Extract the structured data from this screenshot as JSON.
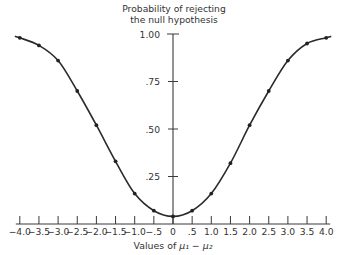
{
  "chart_data": {
    "type": "line",
    "title": "Probability of rejecting the null hypothesis",
    "title_lines": [
      "Probability of rejecting",
      "the null hypothesis"
    ],
    "xlabel": "Values of μ₁ − μ₂",
    "ylabel": "Probability of rejecting the null hypothesis",
    "x": [
      -4.0,
      -3.5,
      -3.0,
      -2.5,
      -2.0,
      -1.5,
      -1.0,
      -0.5,
      0,
      0.5,
      1.0,
      1.5,
      2.0,
      2.5,
      3.0,
      3.5,
      4.0
    ],
    "series": [
      {
        "name": "Power curve",
        "values": [
          0.98,
          0.94,
          0.86,
          0.7,
          0.52,
          0.33,
          0.16,
          0.07,
          0.04,
          0.07,
          0.16,
          0.32,
          0.52,
          0.7,
          0.86,
          0.95,
          0.98
        ],
        "markers": true,
        "smooth": true
      }
    ],
    "x_tick_labels": [
      "−4.0",
      "−3.5",
      "−3.0",
      "−2.5",
      "−2.0",
      "−1.5",
      "−1.0",
      "−.5",
      "0",
      ".5",
      "1.0",
      "1.5",
      "2.0",
      "2.5",
      "3.0",
      "3.5",
      "4.0"
    ],
    "y_ticks": [
      0.25,
      0.5,
      0.75,
      1.0
    ],
    "y_tick_labels": [
      ".25",
      ".50",
      ".75",
      "1.00"
    ],
    "xlim": [
      -4.0,
      4.0
    ],
    "ylim": [
      0,
      1.0
    ],
    "grid": false,
    "legend": null,
    "y_axis_position": "center (x = 0)"
  },
  "labels": {
    "title_line1": "Probability of rejecting",
    "title_line2": "the null hypothesis",
    "xlabel_prefix": "Values of ",
    "xlabel_math": "μ₁ − μ₂"
  }
}
